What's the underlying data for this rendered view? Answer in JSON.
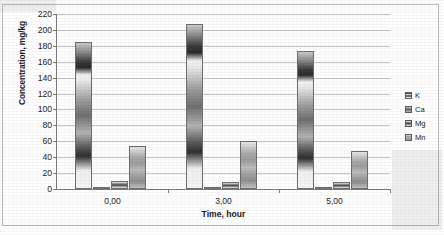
{
  "chart_data": {
    "type": "bar",
    "title": "",
    "xlabel": "Time, hour",
    "ylabel": "Concentration, mg/kg",
    "categories": [
      "0,00",
      "3,00",
      "5,00"
    ],
    "series": [
      {
        "name": "K",
        "values": [
          185,
          207,
          174
        ]
      },
      {
        "name": "Ca",
        "values": [
          3,
          3,
          3
        ]
      },
      {
        "name": "Mg",
        "values": [
          10,
          9,
          9
        ]
      },
      {
        "name": "Mn",
        "values": [
          54,
          60,
          48
        ]
      }
    ],
    "ylim": [
      0,
      220
    ],
    "ytick_step": 20,
    "yticks": [
      0,
      20,
      40,
      60,
      80,
      100,
      120,
      140,
      160,
      180,
      200,
      220
    ],
    "ytick_labels": [
      "0",
      "20",
      "40",
      "60",
      "80",
      "100",
      "120",
      "140",
      "160",
      "180",
      "200",
      "220"
    ],
    "grid": "horizontal",
    "legend_position": "right",
    "palette": [
      "#8e8e8e",
      "#6e6e6e",
      "#5a5a5a",
      "#a8a8a8"
    ],
    "gridline_color": "#c4c4c4",
    "axis_color": "#7d7d7d",
    "background": "#ffffff"
  },
  "legend": {
    "items": [
      {
        "label": "K"
      },
      {
        "label": "Ca"
      },
      {
        "label": "Mg"
      },
      {
        "label": "Mn"
      }
    ]
  }
}
